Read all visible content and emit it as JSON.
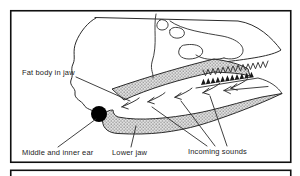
{
  "labels": {
    "fat_body": "Fat body in jaw",
    "middle_inner_ear": "Middle and inner ear",
    "lower_jaw": "Lower jaw",
    "incoming_sounds": "Incoming sounds"
  },
  "colors": {
    "outline": "#2b2b2b",
    "frame": "#101010",
    "background": "#ffffff",
    "stipple_fill": "#e2e2e2",
    "stipple_dot": "#787878",
    "ear_fill": "#000000",
    "teeth_fill": "#1a1a1a"
  }
}
